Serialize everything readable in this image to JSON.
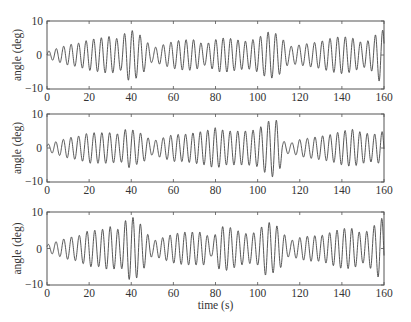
{
  "chart_data": [
    {
      "type": "line",
      "panel": 1,
      "title": "",
      "xlabel": "",
      "ylabel": "angle (deg)",
      "xlim": [
        0,
        160
      ],
      "ylim": [
        -10,
        10
      ],
      "xticks": [
        0,
        20,
        40,
        60,
        80,
        100,
        120,
        140,
        160
      ],
      "yticks": [
        -10,
        0,
        10
      ],
      "grid": false,
      "period_s": 3.6,
      "envelope": {
        "x": [
          0,
          5,
          10,
          15,
          20,
          25,
          30,
          35,
          38,
          42,
          46,
          50,
          55,
          60,
          65,
          70,
          75,
          78,
          82,
          86,
          90,
          95,
          100,
          104,
          106,
          110,
          115,
          120,
          125,
          130,
          135,
          140,
          145,
          150,
          155,
          158,
          160
        ],
        "y": [
          1,
          2,
          3,
          3.5,
          4.5,
          5,
          5.5,
          4.5,
          7.5,
          7,
          5,
          2,
          3,
          4,
          4.5,
          4.5,
          3,
          4,
          5,
          5,
          4.5,
          4,
          5,
          6.5,
          7,
          6,
          2.5,
          3,
          3.5,
          4,
          5,
          5.5,
          5,
          3.5,
          5,
          8,
          7
        ]
      }
    },
    {
      "type": "line",
      "panel": 2,
      "title": "",
      "xlabel": "",
      "ylabel": "angle (deg)",
      "xlim": [
        0,
        160
      ],
      "ylim": [
        -10,
        10
      ],
      "xticks": [
        0,
        20,
        40,
        60,
        80,
        100,
        120,
        140,
        160
      ],
      "yticks": [
        -10,
        0,
        10
      ],
      "grid": false,
      "period_s": 3.6,
      "envelope": {
        "x": [
          0,
          5,
          10,
          15,
          20,
          25,
          30,
          35,
          38,
          42,
          46,
          50,
          55,
          60,
          65,
          70,
          75,
          80,
          85,
          90,
          95,
          100,
          104,
          107,
          110,
          112,
          116,
          120,
          125,
          130,
          135,
          140,
          145,
          150,
          155,
          160
        ],
        "y": [
          1,
          2,
          3,
          3.5,
          4.5,
          4.5,
          4.5,
          4,
          6,
          5,
          4,
          2,
          3,
          4,
          4,
          4.5,
          5,
          6,
          5,
          5,
          5,
          5.5,
          7.5,
          8.5,
          8,
          2,
          1.5,
          2.5,
          3,
          3.5,
          4,
          5,
          5.5,
          4.5,
          4,
          5
        ]
      }
    },
    {
      "type": "line",
      "panel": 3,
      "title": "",
      "xlabel": "time (s)",
      "ylabel": "angle (deg)",
      "xlim": [
        0,
        160
      ],
      "ylim": [
        -10,
        10
      ],
      "xticks": [
        0,
        20,
        40,
        60,
        80,
        100,
        120,
        140,
        160
      ],
      "yticks": [
        -10,
        0,
        10
      ],
      "grid": false,
      "period_s": 3.6,
      "envelope": {
        "x": [
          0,
          5,
          10,
          15,
          20,
          25,
          30,
          35,
          38,
          42,
          46,
          50,
          55,
          60,
          65,
          70,
          75,
          78,
          82,
          86,
          90,
          95,
          100,
          104,
          106,
          110,
          115,
          120,
          125,
          130,
          135,
          140,
          145,
          150,
          155,
          158,
          160
        ],
        "y": [
          1,
          2,
          3,
          3.5,
          5,
          5,
          6,
          5,
          8.5,
          8.5,
          5.5,
          2,
          3,
          4,
          4.5,
          4.5,
          4.5,
          2,
          6,
          6,
          5,
          4,
          4.5,
          7.5,
          7,
          6,
          2,
          3,
          3.5,
          3.5,
          4.5,
          5.5,
          5.5,
          4,
          6,
          8.5,
          8
        ]
      }
    }
  ],
  "axes": {
    "ylabel": "angle (deg)",
    "xlabel": "time (s)",
    "ytick_labels": [
      "10",
      "0",
      "−10"
    ],
    "xtick_labels": [
      "0",
      "20",
      "40",
      "60",
      "80",
      "100",
      "120",
      "140",
      "160"
    ]
  }
}
